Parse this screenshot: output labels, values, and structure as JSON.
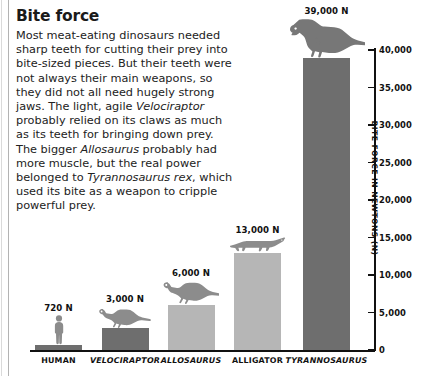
{
  "article": {
    "title": "Bite force",
    "body_segments": [
      {
        "text": "Most meat-eating dinosaurs needed sharp teeth for cutting their prey into bite-sized pieces. But their teeth were not always their main weapons, so they did not all need hugely strong jaws. The light, agile ",
        "italic": false
      },
      {
        "text": "Velociraptor",
        "italic": true
      },
      {
        "text": " probably relied on its claws as much as its teeth for bringing down prey. The bigger ",
        "italic": false
      },
      {
        "text": "Allosaurus",
        "italic": true
      },
      {
        "text": " probably had more muscle, but the real power belonged to ",
        "italic": false
      },
      {
        "text": "Tyrannosaurus rex",
        "italic": true
      },
      {
        "text": ", which used its bite as a weapon to cripple powerful prey.",
        "italic": false
      }
    ]
  },
  "chart_data": {
    "type": "bar",
    "title": "Bite force",
    "xlabel": "",
    "ylabel": "BITE FORCE IN NEWTONS (N)",
    "ylim": [
      0,
      40000
    ],
    "grid": false,
    "legend": "none",
    "categories": [
      "HUMAN",
      "VELOCIRAPTOR",
      "ALLOSAURUS",
      "ALLIGATOR",
      "TYRANNOSAURUS"
    ],
    "values": [
      720,
      3000,
      6000,
      13000,
      39000
    ],
    "value_labels": [
      "720 N",
      "3,000 N",
      "6,000 N",
      "13,000 N",
      "39,000 N"
    ],
    "category_italic": [
      false,
      true,
      true,
      false,
      true
    ],
    "bar_colors": [
      "#6e6e6e",
      "#6e6e6e",
      "#b6b6b6",
      "#b6b6b6",
      "#6e6e6e"
    ],
    "silhouettes": [
      "human-silhouette",
      "velociraptor-silhouette",
      "allosaurus-silhouette",
      "alligator-silhouette",
      "tyrannosaurus-silhouette"
    ],
    "y_ticks": [
      0,
      5000,
      10000,
      15000,
      20000,
      25000,
      30000,
      35000,
      40000
    ],
    "y_tick_labels": [
      "0",
      "5,000",
      "10,000",
      "15,000",
      "20,000",
      "25,000",
      "30,000",
      "35,000",
      "40,000"
    ]
  },
  "colors": {
    "bar_dark": "#6e6e6e",
    "bar_light": "#b6b6b6",
    "axis": "#111111",
    "text": "#222222",
    "background": "#ffffff"
  }
}
